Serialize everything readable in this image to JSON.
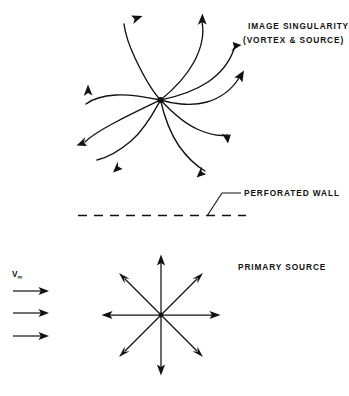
{
  "figure": {
    "background_color": "#ffffff",
    "ink_color": "#111111",
    "labels": {
      "image_singularity_line1": "IMAGE SINGULARITY",
      "image_singularity_line2": "(VORTEX & SOURCE)",
      "perforated_wall": "PERFORATED  WALL",
      "primary_source": "PRIMARY  SOURCE",
      "freestream_symbol": "V",
      "freestream_subscript": "∞"
    },
    "image_singularity": {
      "center_x": 160,
      "center_y": 100,
      "arm_count": 8,
      "spiral_direction": "counterclockwise-outward",
      "inner_radius": 4,
      "outer_radius": 68,
      "arm_sweep_degrees": 150
    },
    "perforated_wall": {
      "y": 215,
      "x_start": 78,
      "x_end": 246,
      "dash_length": 9,
      "gap_length": 7
    },
    "leader_line": {
      "x1": 207,
      "y1": 216,
      "x2": 222,
      "y2": 193,
      "x3": 241,
      "y3": 193
    },
    "primary_source": {
      "center_x": 161,
      "center_y": 315,
      "ray_count": 8,
      "axial_length": 59,
      "diagonal_length": 52
    },
    "freestream_arrows": {
      "count": 3,
      "x_start": 13,
      "x_end": 49,
      "y_values": [
        291,
        313,
        336
      ]
    }
  }
}
